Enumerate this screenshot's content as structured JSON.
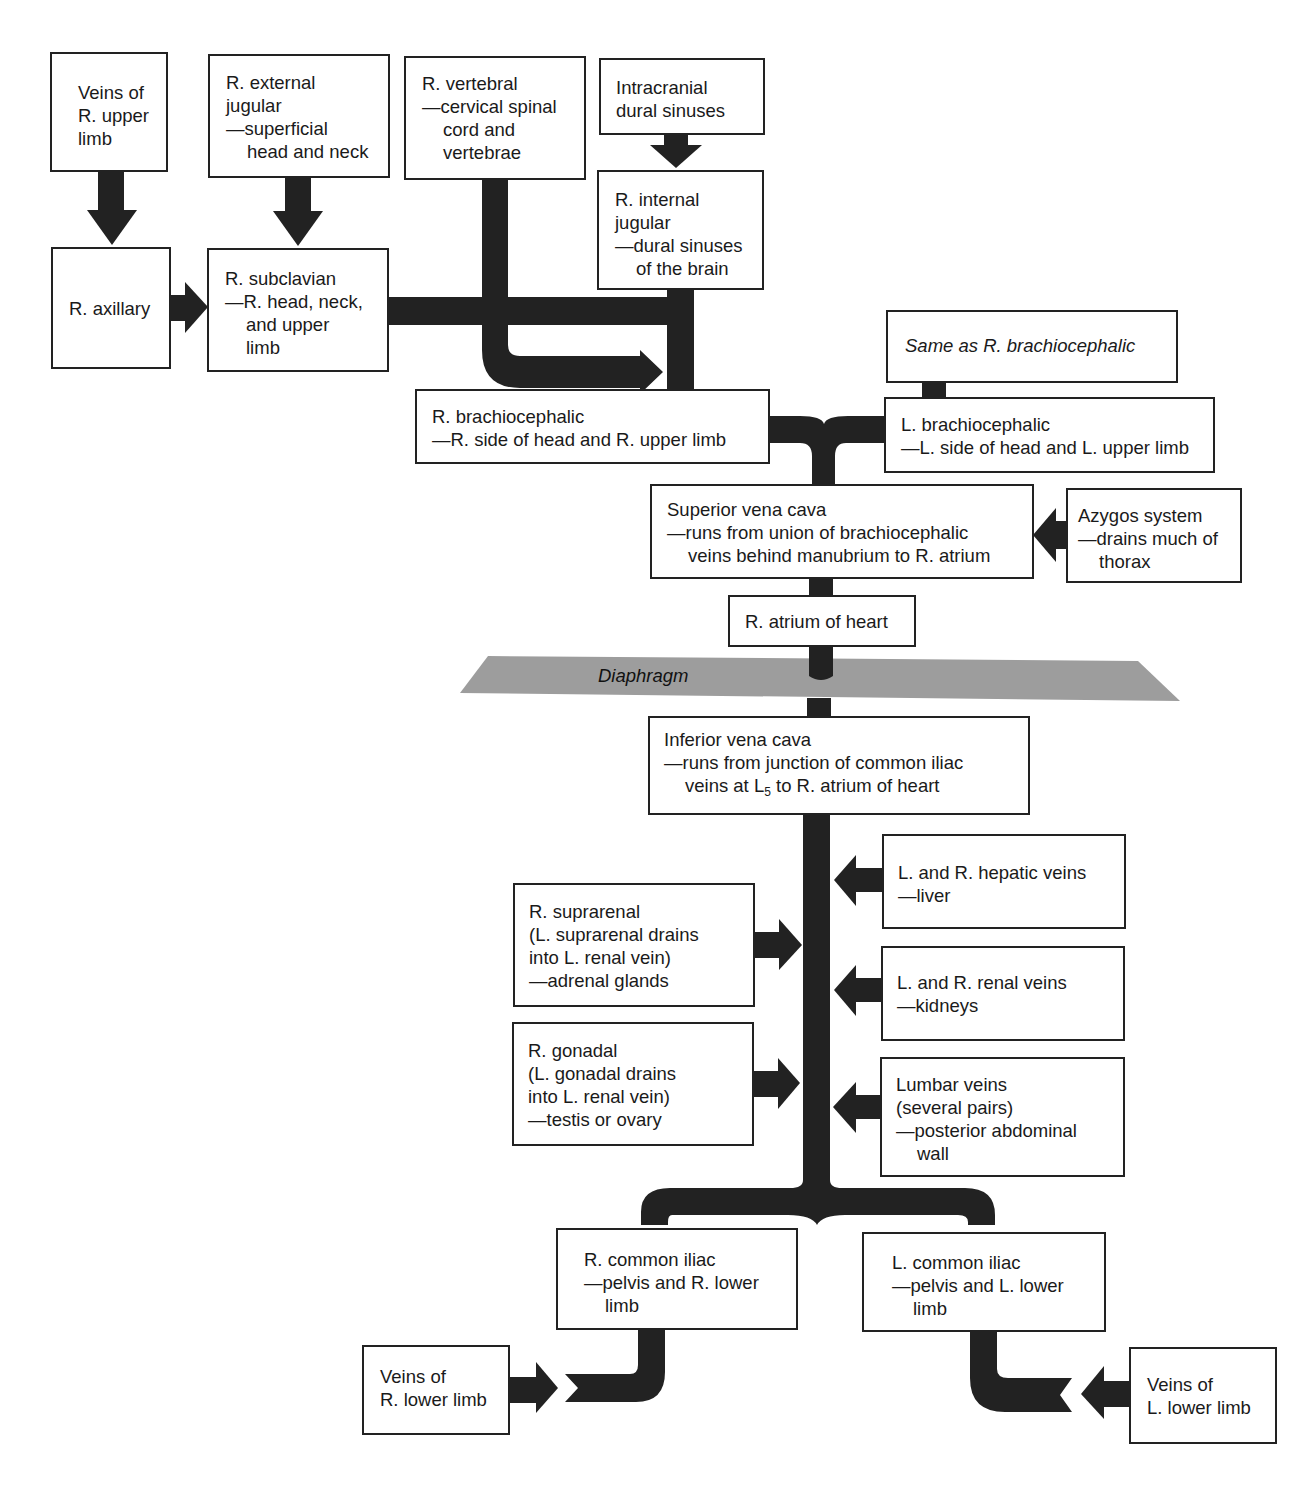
{
  "diagram": {
    "colors": {
      "vessel": "#222222",
      "box_border": "#222222",
      "diaphragm": "#9a9a9a",
      "background": "#ffffff"
    },
    "nodes": {
      "veins_r_upper_limb": {
        "lines": [
          "Veins of",
          "R. upper",
          "limb"
        ]
      },
      "r_external_jugular": {
        "lines": [
          "R. external",
          "jugular",
          "—superficial",
          "head and neck"
        ]
      },
      "r_vertebral": {
        "lines": [
          "R. vertebral",
          "—cervical spinal",
          "cord and",
          "vertebrae"
        ]
      },
      "intracranial_dural_sinuses": {
        "lines": [
          "Intracranial",
          "dural sinuses"
        ]
      },
      "r_axillary": {
        "lines": [
          "R. axillary"
        ]
      },
      "r_subclavian": {
        "lines": [
          "R. subclavian",
          "—R. head, neck,",
          "and upper",
          "limb"
        ]
      },
      "r_internal_jugular": {
        "lines": [
          "R. internal",
          "jugular",
          "—dural sinuses",
          "of the brain"
        ]
      },
      "same_as_r_brachiocephalic": {
        "lines": [
          "Same as R. brachiocephalic"
        ]
      },
      "r_brachiocephalic": {
        "lines": [
          "R. brachiocephalic",
          "—R. side of head and R. upper limb"
        ]
      },
      "l_brachiocephalic": {
        "lines": [
          "L. brachiocephalic",
          "—L. side of head and L. upper limb"
        ]
      },
      "superior_vena_cava": {
        "lines": [
          "Superior vena cava",
          "—runs from union of brachiocephalic",
          "veins behind manubrium to R. atrium"
        ]
      },
      "azygos_system": {
        "lines": [
          "Azygos system",
          "—drains much of",
          "thorax"
        ]
      },
      "r_atrium": {
        "lines": [
          "R. atrium of heart"
        ]
      },
      "diaphragm": {
        "label": "Diaphragm"
      },
      "inferior_vena_cava": {
        "line1": "Inferior vena cava",
        "line2": "—runs from junction of common iliac",
        "line3_pre": "veins at L",
        "line3_sub": "5",
        "line3_post": " to R. atrium of heart"
      },
      "hepatic_veins": {
        "lines": [
          "L. and R. hepatic veins",
          "—liver"
        ]
      },
      "r_suprarenal": {
        "lines": [
          "R. suprarenal",
          "(L. suprarenal drains",
          "into L. renal vein)",
          "—adrenal glands"
        ]
      },
      "renal_veins": {
        "lines": [
          "L. and R. renal veins",
          "—kidneys"
        ]
      },
      "r_gonadal": {
        "lines": [
          "R. gonadal",
          "(L. gonadal drains",
          "into L. renal vein)",
          "—testis or ovary"
        ]
      },
      "lumbar_veins": {
        "lines": [
          "Lumbar veins",
          "(several pairs)",
          "—posterior abdominal",
          "wall"
        ]
      },
      "r_common_iliac": {
        "lines": [
          "R. common iliac",
          "—pelvis and R. lower",
          "limb"
        ]
      },
      "l_common_iliac": {
        "lines": [
          "L. common iliac",
          "—pelvis and L. lower",
          "limb"
        ]
      },
      "veins_r_lower_limb": {
        "lines": [
          "Veins of",
          "R. lower limb"
        ]
      },
      "veins_l_lower_limb": {
        "lines": [
          "Veins of",
          "L. lower limb"
        ]
      }
    },
    "edges": [
      [
        "veins_r_upper_limb",
        "r_axillary"
      ],
      [
        "r_external_jugular",
        "r_subclavian"
      ],
      [
        "r_axillary",
        "r_subclavian"
      ],
      [
        "intracranial_dural_sinuses",
        "r_internal_jugular"
      ],
      [
        "r_subclavian",
        "r_brachiocephalic"
      ],
      [
        "r_vertebral",
        "r_brachiocephalic"
      ],
      [
        "r_internal_jugular",
        "r_brachiocephalic"
      ],
      [
        "same_as_r_brachiocephalic",
        "l_brachiocephalic"
      ],
      [
        "r_brachiocephalic",
        "superior_vena_cava"
      ],
      [
        "l_brachiocephalic",
        "superior_vena_cava"
      ],
      [
        "azygos_system",
        "superior_vena_cava"
      ],
      [
        "superior_vena_cava",
        "r_atrium"
      ],
      [
        "inferior_vena_cava",
        "r_atrium"
      ],
      [
        "hepatic_veins",
        "inferior_vena_cava"
      ],
      [
        "r_suprarenal",
        "inferior_vena_cava"
      ],
      [
        "renal_veins",
        "inferior_vena_cava"
      ],
      [
        "r_gonadal",
        "inferior_vena_cava"
      ],
      [
        "lumbar_veins",
        "inferior_vena_cava"
      ],
      [
        "r_common_iliac",
        "inferior_vena_cava"
      ],
      [
        "l_common_iliac",
        "inferior_vena_cava"
      ],
      [
        "veins_r_lower_limb",
        "r_common_iliac"
      ],
      [
        "veins_l_lower_limb",
        "l_common_iliac"
      ]
    ]
  }
}
